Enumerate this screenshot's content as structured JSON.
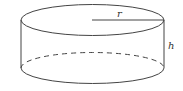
{
  "diagram": {
    "type": "cylinder",
    "labels": {
      "radius": "r",
      "height": "h"
    },
    "colors": {
      "stroke": "#444444",
      "text": "#333333",
      "background": "#ffffff"
    }
  }
}
